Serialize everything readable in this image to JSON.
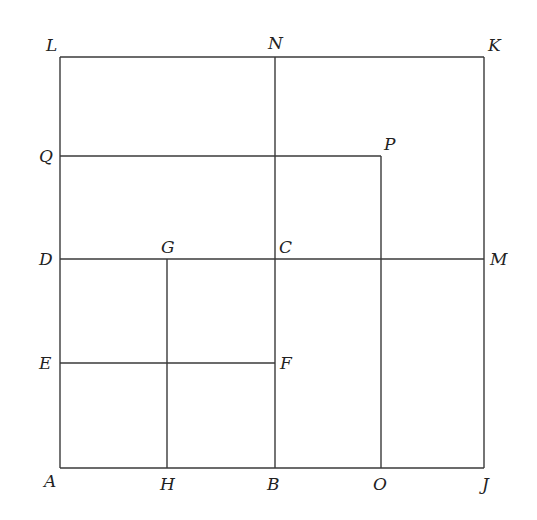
{
  "diagram": {
    "title": "",
    "stroke_color": "#3a3a3a",
    "label_color": "#222222",
    "segments": [
      {
        "name": "side-LK",
        "from": "L",
        "to": "K",
        "x1": 60,
        "y1": 57,
        "x2": 484,
        "y2": 57
      },
      {
        "name": "side-KJ",
        "from": "K",
        "to": "J",
        "x1": 484,
        "y1": 57,
        "x2": 484,
        "y2": 468
      },
      {
        "name": "side-JA",
        "from": "J",
        "to": "A",
        "x1": 484,
        "y1": 468,
        "x2": 60,
        "y2": 468
      },
      {
        "name": "side-AL",
        "from": "A",
        "to": "L",
        "x1": 60,
        "y1": 468,
        "x2": 60,
        "y2": 57
      },
      {
        "name": "segment-NB",
        "from": "N",
        "to": "B",
        "x1": 275,
        "y1": 57,
        "x2": 275,
        "y2": 468
      },
      {
        "name": "segment-DM",
        "from": "D",
        "to": "M",
        "x1": 60,
        "y1": 259,
        "x2": 484,
        "y2": 259
      },
      {
        "name": "segment-QP",
        "from": "Q",
        "to": "P",
        "x1": 60,
        "y1": 156,
        "x2": 381,
        "y2": 156
      },
      {
        "name": "segment-PO",
        "from": "P",
        "to": "O",
        "x1": 381,
        "y1": 156,
        "x2": 381,
        "y2": 468
      },
      {
        "name": "segment-GH",
        "from": "G",
        "to": "H",
        "x1": 167,
        "y1": 259,
        "x2": 167,
        "y2": 468
      },
      {
        "name": "segment-EF",
        "from": "E",
        "to": "F",
        "x1": 60,
        "y1": 363,
        "x2": 275,
        "y2": 363
      }
    ],
    "points": [
      {
        "label": "L",
        "x": 46,
        "y": 51
      },
      {
        "label": "N",
        "x": 268,
        "y": 49
      },
      {
        "label": "K",
        "x": 488,
        "y": 51
      },
      {
        "label": "Q",
        "x": 39,
        "y": 162
      },
      {
        "label": "P",
        "x": 384,
        "y": 150
      },
      {
        "label": "D",
        "x": 39,
        "y": 265
      },
      {
        "label": "G",
        "x": 161,
        "y": 253
      },
      {
        "label": "C",
        "x": 279,
        "y": 253
      },
      {
        "label": "M",
        "x": 490,
        "y": 265
      },
      {
        "label": "E",
        "x": 39,
        "y": 369
      },
      {
        "label": "F",
        "x": 280,
        "y": 369
      },
      {
        "label": "A",
        "x": 44,
        "y": 487
      },
      {
        "label": "H",
        "x": 160,
        "y": 490
      },
      {
        "label": "B",
        "x": 267,
        "y": 490
      },
      {
        "label": "O",
        "x": 373,
        "y": 490
      },
      {
        "label": "J",
        "x": 482,
        "y": 490
      }
    ]
  }
}
